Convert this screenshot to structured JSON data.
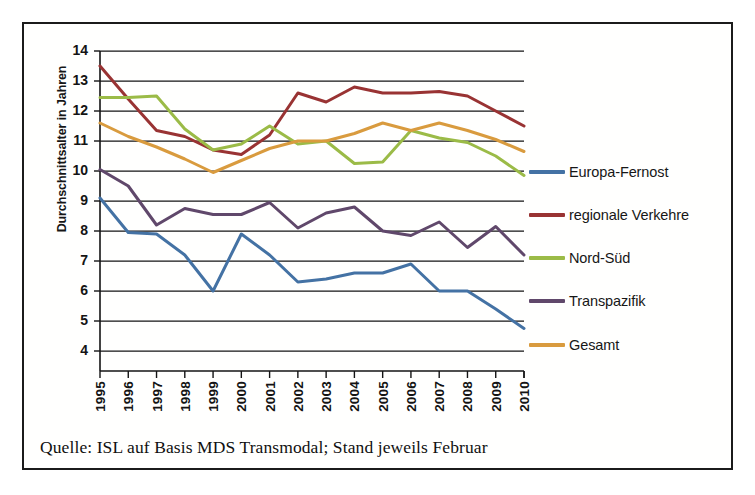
{
  "figure": {
    "caption": "Quelle: ISL auf Basis MDS Transmodal; Stand jeweils Februar"
  },
  "chart_data": {
    "type": "line",
    "title": "",
    "xlabel": "",
    "ylabel": "Durchschnittsalter in Jahren",
    "ylim": [
      4,
      14
    ],
    "yticks": [
      "4",
      "5",
      "6",
      "7",
      "8",
      "9",
      "10",
      "11",
      "12",
      "13",
      "14"
    ],
    "grid": true,
    "legend_position": "right",
    "categories": [
      "1995",
      "1996",
      "1997",
      "1998",
      "1999",
      "2000",
      "2001",
      "2002",
      "2003",
      "2004",
      "2005",
      "2006",
      "2007",
      "2008",
      "2009",
      "2010"
    ],
    "series": [
      {
        "name": "Europa-Fernost",
        "color": "#4472a4",
        "values": [
          9.1,
          7.95,
          7.9,
          7.2,
          6.0,
          7.9,
          7.2,
          6.3,
          6.4,
          6.6,
          6.6,
          6.9,
          6.0,
          6.0,
          5.4,
          4.75
        ]
      },
      {
        "name": "regionale Verkehre",
        "color": "#993333",
        "values": [
          13.5,
          12.4,
          11.35,
          11.15,
          10.7,
          10.55,
          11.2,
          12.6,
          12.3,
          12.8,
          12.6,
          12.6,
          12.65,
          12.5,
          12.0,
          11.5
        ]
      },
      {
        "name": "Nord-Süd",
        "color": "#9bbb47",
        "values": [
          12.45,
          12.45,
          12.5,
          11.4,
          10.7,
          10.9,
          11.5,
          10.9,
          11.0,
          10.25,
          10.3,
          11.35,
          11.1,
          10.95,
          10.5,
          9.85
        ]
      },
      {
        "name": "Transpazifik",
        "color": "#60486b",
        "values": [
          10.05,
          9.5,
          8.2,
          8.75,
          8.55,
          8.55,
          8.95,
          8.1,
          8.6,
          8.8,
          8.0,
          7.85,
          8.3,
          7.45,
          8.15,
          7.2
        ]
      },
      {
        "name": "Gesamt",
        "color": "#d99b3e",
        "values": [
          11.6,
          11.15,
          10.8,
          10.4,
          9.95,
          10.35,
          10.75,
          11.0,
          11.0,
          11.25,
          11.6,
          11.35,
          11.6,
          11.35,
          11.05,
          10.65
        ]
      }
    ]
  }
}
